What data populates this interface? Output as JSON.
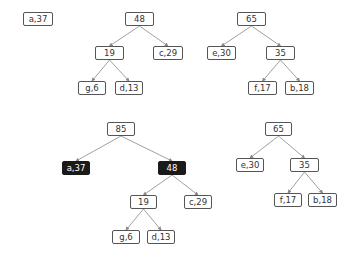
{
  "nodes": [
    {
      "id": "t1_a37",
      "label": "a,37",
      "x": 23,
      "y": 12,
      "w": 30,
      "dark": false
    },
    {
      "id": "t2_48",
      "label": "48",
      "x": 125,
      "y": 12,
      "w": 29,
      "dark": false
    },
    {
      "id": "t2_19",
      "label": "19",
      "x": 95,
      "y": 46,
      "w": 29,
      "dark": false
    },
    {
      "id": "t2_c29",
      "label": "c,29",
      "x": 153,
      "y": 46,
      "w": 30,
      "dark": false
    },
    {
      "id": "t2_g6",
      "label": "g,6",
      "x": 78,
      "y": 81,
      "w": 28,
      "dark": false
    },
    {
      "id": "t2_d13",
      "label": "d,13",
      "x": 115,
      "y": 81,
      "w": 28,
      "dark": false
    },
    {
      "id": "t3_65",
      "label": "65",
      "x": 237,
      "y": 12,
      "w": 29,
      "dark": false
    },
    {
      "id": "t3_e30",
      "label": "e,30",
      "x": 207,
      "y": 46,
      "w": 29,
      "dark": false
    },
    {
      "id": "t3_35",
      "label": "35",
      "x": 266,
      "y": 46,
      "w": 29,
      "dark": false
    },
    {
      "id": "t3_f17",
      "label": "f,17",
      "x": 248,
      "y": 81,
      "w": 29,
      "dark": false
    },
    {
      "id": "t3_b18",
      "label": "b,18",
      "x": 285,
      "y": 81,
      "w": 29,
      "dark": false
    },
    {
      "id": "t4_85",
      "label": "85",
      "x": 107,
      "y": 122,
      "w": 28,
      "dark": false
    },
    {
      "id": "t4_a37",
      "label": "a,37",
      "x": 62,
      "y": 161,
      "w": 28,
      "dark": true
    },
    {
      "id": "t4_48",
      "label": "48",
      "x": 158,
      "y": 161,
      "w": 28,
      "dark": true
    },
    {
      "id": "t4_19",
      "label": "19",
      "x": 130,
      "y": 195,
      "w": 27,
      "dark": false
    },
    {
      "id": "t4_c29",
      "label": "c,29",
      "x": 184,
      "y": 195,
      "w": 28,
      "dark": false
    },
    {
      "id": "t4_g6",
      "label": "g,6",
      "x": 112,
      "y": 230,
      "w": 28,
      "dark": false
    },
    {
      "id": "t4_d13",
      "label": "d,13",
      "x": 147,
      "y": 230,
      "w": 28,
      "dark": false
    },
    {
      "id": "t5_65",
      "label": "65",
      "x": 265,
      "y": 122,
      "w": 27,
      "dark": false
    },
    {
      "id": "t5_e30",
      "label": "e,30",
      "x": 236,
      "y": 158,
      "w": 28,
      "dark": false
    },
    {
      "id": "t5_35",
      "label": "35",
      "x": 290,
      "y": 158,
      "w": 29,
      "dark": false
    },
    {
      "id": "t5_f17",
      "label": "f,17",
      "x": 274,
      "y": 193,
      "w": 28,
      "dark": false
    },
    {
      "id": "t5_b18",
      "label": "b,18",
      "x": 308,
      "y": 193,
      "w": 29,
      "dark": false
    }
  ],
  "edges": [
    [
      "t2_48",
      "t2_19"
    ],
    [
      "t2_48",
      "t2_c29"
    ],
    [
      "t2_19",
      "t2_g6"
    ],
    [
      "t2_19",
      "t2_d13"
    ],
    [
      "t3_65",
      "t3_e30"
    ],
    [
      "t3_65",
      "t3_35"
    ],
    [
      "t3_35",
      "t3_f17"
    ],
    [
      "t3_35",
      "t3_b18"
    ],
    [
      "t4_85",
      "t4_a37"
    ],
    [
      "t4_85",
      "t4_48"
    ],
    [
      "t4_48",
      "t4_19"
    ],
    [
      "t4_48",
      "t4_c29"
    ],
    [
      "t4_19",
      "t4_g6"
    ],
    [
      "t4_19",
      "t4_d13"
    ],
    [
      "t5_65",
      "t5_e30"
    ],
    [
      "t5_65",
      "t5_35"
    ],
    [
      "t5_35",
      "t5_f17"
    ],
    [
      "t5_35",
      "t5_b18"
    ]
  ],
  "colors": {
    "edge": "#888888",
    "node_border": "#555555",
    "dark_fill": "#1a1a1a"
  }
}
